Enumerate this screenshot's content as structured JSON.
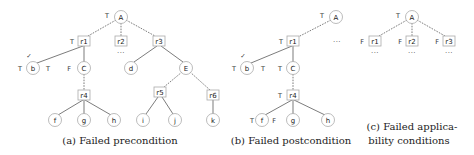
{
  "figure": {
    "panels": [
      {
        "id": "a",
        "caption": "(a) Failed precondition",
        "nodes": {
          "A": {
            "label": "A",
            "shape": "circle",
            "tag": "T"
          },
          "r1": {
            "label": "r1",
            "shape": "box",
            "tag": "T"
          },
          "r2": {
            "label": "r2",
            "shape": "box",
            "ellipsis": "···"
          },
          "r3": {
            "label": "r3",
            "shape": "box"
          },
          "b": {
            "label": "b",
            "shape": "circle",
            "tag_left": "T",
            "tag_right": "T",
            "mark": "✓"
          },
          "C": {
            "label": "C",
            "shape": "circle",
            "tag": "F"
          },
          "d": {
            "label": "d",
            "shape": "circle"
          },
          "E": {
            "label": "E",
            "shape": "circle"
          },
          "r4": {
            "label": "r4",
            "shape": "box"
          },
          "r5": {
            "label": "r5",
            "shape": "box"
          },
          "r6": {
            "label": "r6",
            "shape": "box"
          },
          "f": {
            "label": "f",
            "shape": "circle"
          },
          "g": {
            "label": "g",
            "shape": "circle"
          },
          "h": {
            "label": "h",
            "shape": "circle"
          },
          "i": {
            "label": "i",
            "shape": "circle"
          },
          "j": {
            "label": "j",
            "shape": "circle"
          },
          "k": {
            "label": "k",
            "shape": "circle"
          }
        }
      },
      {
        "id": "b",
        "caption": "(b) Failed postcondition",
        "nodes": {
          "A": {
            "label": "A",
            "shape": "circle",
            "tag": "T"
          },
          "r1": {
            "label": "r1",
            "shape": "box",
            "tag": "T"
          },
          "siblings_ellipsis": "···",
          "b": {
            "label": "b",
            "shape": "circle",
            "tag_left": "T",
            "tag_right": "T",
            "mark": "✓"
          },
          "C": {
            "label": "C",
            "shape": "circle",
            "tag": "T"
          },
          "r4": {
            "label": "r4",
            "shape": "box",
            "tag": "T"
          },
          "f": {
            "label": "f",
            "shape": "circle",
            "tag_left": "T",
            "tag_right": "F"
          },
          "g": {
            "label": "g",
            "shape": "circle"
          },
          "h": {
            "label": "h",
            "shape": "circle"
          }
        }
      },
      {
        "id": "c",
        "caption_line1": "(c) Failed applica-",
        "caption_line2": "bility conditions",
        "nodes": {
          "A": {
            "label": "A",
            "shape": "circle",
            "tag": "T"
          },
          "r1": {
            "label": "r1",
            "shape": "box",
            "tag": "F",
            "ellipsis": "···"
          },
          "r2": {
            "label": "r2",
            "shape": "box",
            "tag": "F",
            "ellipsis": "···"
          },
          "r3": {
            "label": "r3",
            "shape": "box",
            "tag": "F",
            "ellipsis": "···"
          }
        }
      }
    ]
  }
}
